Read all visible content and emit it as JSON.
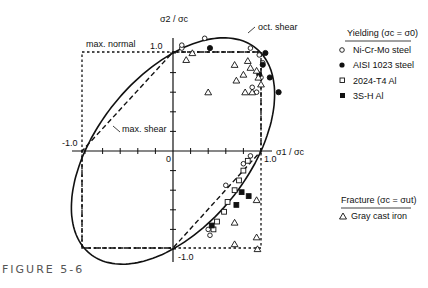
{
  "figure_label": "FIGURE 5-6",
  "chart_data": {
    "type": "scatter",
    "title": "",
    "xlabel": "σ1 / σc",
    "ylabel": "σ2 / σc",
    "xlim": [
      -1.1,
      1.1
    ],
    "ylim": [
      -1.1,
      1.1
    ],
    "tick_labels": {
      "x": [
        "-1.0",
        "0",
        "1.0"
      ],
      "y": [
        "1.0",
        "-1.0"
      ]
    },
    "curves": [
      {
        "name": "max. normal",
        "style": "dotted",
        "description": "square |σ1|=1, |σ2|=1"
      },
      {
        "name": "max. shear",
        "style": "dashed",
        "description": "Tresca hexagon"
      },
      {
        "name": "oct. shear",
        "style": "solid",
        "description": "von Mises ellipse σ1²−σ1σ2+σ2²=1"
      }
    ],
    "legend": {
      "yielding_title": "Yielding (σc = σ0)",
      "yielding": [
        {
          "symbol": "open-circle",
          "label": "Ni-Cr-Mo steel"
        },
        {
          "symbol": "filled-circle",
          "label": "AISI 1023  steel"
        },
        {
          "symbol": "open-square",
          "label": "2024-T4 Al"
        },
        {
          "symbol": "filled-square",
          "label": "3S-H Al"
        }
      ],
      "fracture_title": "Fracture (σc = σut)",
      "fracture": [
        {
          "symbol": "open-triangle",
          "label": "Gray cast iron"
        }
      ]
    },
    "series": [
      {
        "name": "Ni-Cr-Mo steel",
        "points": [
          [
            0.36,
            1.15
          ],
          [
            0.1,
            1.05
          ],
          [
            0.1,
            1.08
          ],
          [
            0.88,
            1.05
          ],
          [
            0.98,
            0.98
          ],
          [
            1.02,
            0.9
          ],
          [
            0.95,
            0.6
          ],
          [
            1.0,
            0.75
          ],
          [
            0.88,
            -0.05
          ],
          [
            0.8,
            -0.13
          ],
          [
            0.6,
            -0.35
          ],
          [
            0.4,
            -0.8
          ],
          [
            0.42,
            -0.86
          ],
          [
            0.9,
            0.65
          ]
        ]
      },
      {
        "name": "AISI 1023 steel",
        "points": [
          [
            0.42,
            1.05
          ],
          [
            1.05,
            1.0
          ],
          [
            1.02,
            0.88
          ],
          [
            1.1,
            0.75
          ],
          [
            1.2,
            0.6
          ],
          [
            0.98,
            0.78
          ]
        ]
      },
      {
        "name": "2024-T4 Al",
        "points": [
          [
            0.75,
            -0.3
          ],
          [
            0.7,
            -0.4
          ],
          [
            0.62,
            -0.52
          ],
          [
            0.58,
            -0.62
          ],
          [
            0.5,
            -0.72
          ],
          [
            0.46,
            -0.8
          ],
          [
            0.85,
            -0.1
          ],
          [
            0.8,
            -0.2
          ]
        ]
      },
      {
        "name": "3S-H Al",
        "points": [
          [
            0.78,
            -0.42
          ],
          [
            0.86,
            -0.46
          ],
          [
            0.72,
            -0.55
          ],
          [
            0.44,
            -0.76
          ]
        ]
      },
      {
        "name": "Gray cast iron",
        "points": [
          [
            0.22,
            1.0
          ],
          [
            0.15,
            0.93
          ],
          [
            0.7,
            0.88
          ],
          [
            0.85,
            0.92
          ],
          [
            0.88,
            0.85
          ],
          [
            0.8,
            0.78
          ],
          [
            0.72,
            0.72
          ],
          [
            0.82,
            0.6
          ],
          [
            0.95,
            0.82
          ],
          [
            0.97,
            0.75
          ],
          [
            0.4,
            0.6
          ],
          [
            0.9,
            0.6
          ],
          [
            1.0,
            0.68
          ],
          [
            0.95,
            -0.88
          ],
          [
            0.7,
            -0.95
          ],
          [
            0.96,
            -1.0
          ],
          [
            0.95,
            -0.5
          ],
          [
            0.7,
            -0.73
          ]
        ]
      }
    ]
  }
}
